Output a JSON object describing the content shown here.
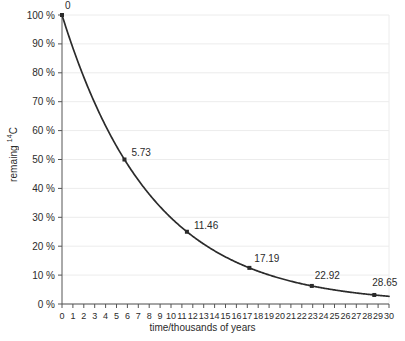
{
  "chart_data": {
    "type": "line",
    "title": "",
    "xlabel": "time/thousands of years",
    "ylabel": "remaing 14C",
    "ylabel_prefix": "remaing ",
    "ylabel_superscript": "14",
    "ylabel_suffix": "C",
    "xlim": [
      0,
      30
    ],
    "ylim": [
      0,
      100
    ],
    "grid": true,
    "grid_axis": "y",
    "legend": false,
    "x_tick_labels": [
      "0",
      "1",
      "2",
      "3",
      "4",
      "5",
      "6",
      "7",
      "8",
      "9",
      "10",
      "11",
      "12",
      "13",
      "14",
      "15",
      "16",
      "17",
      "18",
      "19",
      "20",
      "21",
      "22",
      "23",
      "24",
      "25",
      "26",
      "27",
      "28",
      "29",
      "30"
    ],
    "x_ticks": [
      0,
      1,
      2,
      3,
      4,
      5,
      6,
      7,
      8,
      9,
      10,
      11,
      12,
      13,
      14,
      15,
      16,
      17,
      18,
      19,
      20,
      21,
      22,
      23,
      24,
      25,
      26,
      27,
      28,
      29,
      30
    ],
    "y_tick_labels": [
      "0 %",
      "10 %",
      "20 %",
      "30 %",
      "40 %",
      "50 %",
      "60 %",
      "70 %",
      "80 %",
      "90 %",
      "100 %"
    ],
    "y_ticks": [
      0,
      10,
      20,
      30,
      40,
      50,
      60,
      70,
      80,
      90,
      100
    ],
    "series": [
      {
        "name": "remaining 14C",
        "color": "#2b2b2b",
        "half_life": 5.73,
        "points": [
          {
            "x": 0,
            "y": 100,
            "label": "0"
          },
          {
            "x": 5.73,
            "y": 50,
            "label": "5.73"
          },
          {
            "x": 11.46,
            "y": 25,
            "label": "11.46"
          },
          {
            "x": 17.19,
            "y": 12.5,
            "label": "17.19"
          },
          {
            "x": 22.92,
            "y": 6.25,
            "label": "22.92"
          },
          {
            "x": 28.65,
            "y": 3.125,
            "label": "28.65"
          }
        ]
      }
    ],
    "annotations": [
      {
        "text": "0",
        "x": 0,
        "y": 100
      },
      {
        "text": "5.73",
        "x": 5.73,
        "y": 50
      },
      {
        "text": "11.46",
        "x": 11.46,
        "y": 25
      },
      {
        "text": "17.19",
        "x": 17.19,
        "y": 12.5
      },
      {
        "text": "22.92",
        "x": 22.92,
        "y": 6.25
      },
      {
        "text": "28.65",
        "x": 28.65,
        "y": 3.125
      }
    ],
    "colors": {
      "curve": "#2b2b2b",
      "axis": "#555555",
      "grid": "#ececec",
      "text": "#2b2b2b",
      "background": "#ffffff"
    }
  }
}
